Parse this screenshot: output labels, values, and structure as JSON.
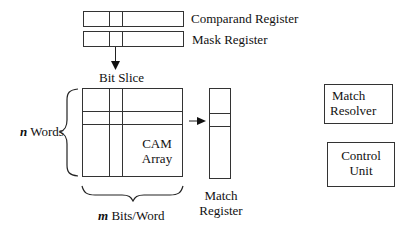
{
  "diagram": {
    "comparand_register": {
      "label": "Comparand Register"
    },
    "mask_register": {
      "label": "Mask Register"
    },
    "bit_slice": {
      "label": "Bit Slice"
    },
    "cam_array": {
      "line1": "CAM",
      "line2": "Array"
    },
    "words": {
      "var": "n",
      "label": "Words"
    },
    "bits_per_word": {
      "var": "m",
      "label": "Bits/Word"
    },
    "match_register": {
      "line1": "Match",
      "line2": "Register"
    },
    "match_resolver": {
      "line1": "Match",
      "line2": "Resolver"
    },
    "control_unit": {
      "line1": "Control",
      "line2": "Unit"
    }
  }
}
